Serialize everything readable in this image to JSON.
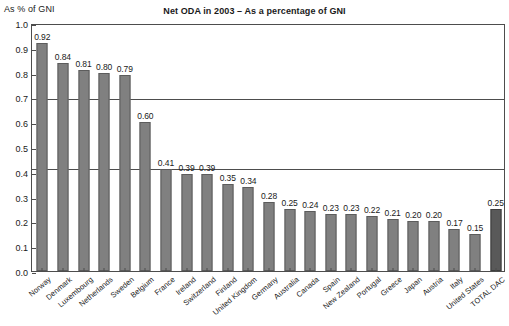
{
  "chart_data": {
    "type": "bar",
    "title": "Net ODA in 2003 – As a percentage of GNI",
    "ylabel": "As % of GNI",
    "xlabel": "",
    "ylim": [
      0.0,
      1.0
    ],
    "ytick_labels": [
      "1.0",
      "0.9",
      "0.8",
      "0.7",
      "0.6",
      "0.5",
      "0.4",
      "0.3",
      "0.2",
      "0.1",
      "0.0"
    ],
    "ytick_values": [
      1.0,
      0.9,
      0.8,
      0.7,
      0.6,
      0.5,
      0.4,
      0.3,
      0.2,
      0.1,
      0.0
    ],
    "grid": "horizontal reference lines at 0.70 and 0.42",
    "gridlines": [
      0.7,
      0.42
    ],
    "legend": "none",
    "categories": [
      "Norway",
      "Denmark",
      "Luxembourg",
      "Netherlands",
      "Sweden",
      "Belgium",
      "France",
      "Ireland",
      "Switzerland",
      "Finland",
      "United Kingdom",
      "Germany",
      "Australia",
      "Canada",
      "Spain",
      "New Zealand",
      "Portugal",
      "Greece",
      "Japan",
      "Austria",
      "Italy",
      "United States",
      "TOTAL DAC"
    ],
    "values": [
      0.92,
      0.84,
      0.81,
      0.8,
      0.79,
      0.6,
      0.41,
      0.39,
      0.39,
      0.35,
      0.34,
      0.28,
      0.25,
      0.24,
      0.23,
      0.23,
      0.22,
      0.21,
      0.2,
      0.2,
      0.17,
      0.15,
      0.25
    ],
    "value_labels": [
      "0.92",
      "0.84",
      "0.81",
      "0.80",
      "0.79",
      "0.60",
      "0.41",
      "0.39",
      "0.39",
      "0.35",
      "0.34",
      "0.28",
      "0.25",
      "0.24",
      "0.23",
      "0.23",
      "0.22",
      "0.21",
      "0.20",
      "0.20",
      "0.17",
      "0.15",
      "0.25"
    ],
    "highlight_index": 22,
    "colors": {
      "bar": "#808080",
      "bar_border": "#5c5c5c",
      "bar_highlight": "#595959",
      "bar_highlight_border": "#3d3d3d",
      "axis": "#4d4d4d",
      "background": "#ffffff",
      "text": "#1a1a1a"
    }
  }
}
